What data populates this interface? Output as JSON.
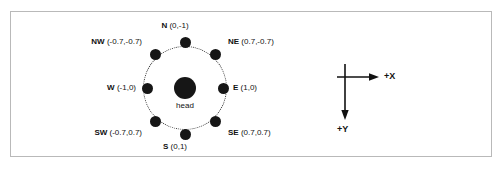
{
  "figure": {
    "title": "",
    "head_label": "head",
    "directions": [
      {
        "name": "N",
        "coords": "(0,-1)",
        "dx": 0,
        "dy": -1
      },
      {
        "name": "NE",
        "coords": "(0.7,-0.7)",
        "dx": 0.7,
        "dy": -0.7
      },
      {
        "name": "E",
        "coords": "(1,0)",
        "dx": 1,
        "dy": 0
      },
      {
        "name": "SE",
        "coords": "(0.7,0.7)",
        "dx": 0.7,
        "dy": 0.7
      },
      {
        "name": "S",
        "coords": "(0,1)",
        "dx": 0,
        "dy": 1
      },
      {
        "name": "SW",
        "coords": "(-0.7,0.7)",
        "dx": -0.7,
        "dy": 0.7
      },
      {
        "name": "W",
        "coords": "(-1,0)",
        "dx": -1,
        "dy": 0
      },
      {
        "name": "NW",
        "coords": "(-0.7,-0.7)",
        "dx": -0.7,
        "dy": -0.7
      }
    ],
    "axis_key": {
      "x_label": "+X",
      "y_label": "+Y"
    },
    "colors": {
      "node": "#161616",
      "ring": "#2b2b2b",
      "frame": "#b9b9b9",
      "text": "#111111",
      "background": "#ffffff"
    }
  }
}
